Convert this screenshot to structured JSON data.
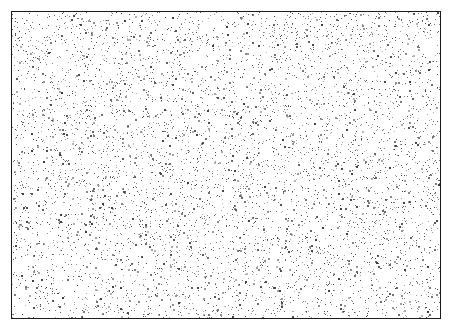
{
  "figure": {
    "width": 455,
    "height": 331,
    "background_color": "#ffffff",
    "title": "",
    "subtitle": ""
  },
  "plot_frame": {
    "x": 11,
    "y": 11,
    "width": 430,
    "height": 308,
    "border_color": "#1a1a1a",
    "border_width": 1,
    "fill_color": "#ffffff"
  },
  "axes": {
    "x_label": "",
    "y_label": "",
    "x_tick_labels": [],
    "y_tick_labels": [],
    "grid": false,
    "xlim": [
      0,
      1
    ],
    "ylim": [
      0,
      1
    ]
  },
  "legend": {
    "visible": false,
    "entries": []
  },
  "chart_data": {
    "type": "scatter",
    "title": "",
    "xlabel": "",
    "ylabel": "",
    "xlim": [
      0,
      1
    ],
    "ylim": [
      0,
      1
    ],
    "grid": false,
    "legend_position": "none",
    "series": [
      {
        "name": "uniform-random-points",
        "marker": "point",
        "marker_size_px": 1,
        "color": "#3c3c3c",
        "opacity": 0.85,
        "n_points": 6200,
        "distribution": "uniform",
        "seed": 20240517
      }
    ]
  },
  "render": {
    "point_color": "#3c3c3c",
    "point_min_alpha": 0.35,
    "point_max_alpha": 1.0,
    "point_size_px": 1,
    "point_size_variation": 1
  }
}
